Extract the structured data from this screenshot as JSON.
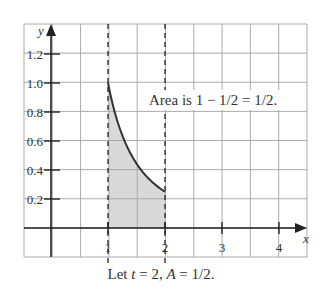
{
  "chart_data": {
    "type": "area",
    "title": "",
    "function": "y = 1/x^2",
    "xlabel": "x",
    "ylabel": "y",
    "x_ticks": [
      "1",
      "2",
      "3",
      "4"
    ],
    "y_ticks": [
      "0.2",
      "0.4",
      "0.6",
      "0.8",
      "1.0",
      "1.2"
    ],
    "xlim": [
      -1,
      5
    ],
    "ylim": [
      -0.2,
      1.4
    ],
    "grid": true,
    "shaded_interval": [
      1,
      2
    ],
    "dashed_lines_x": [
      1,
      2
    ],
    "curve_points": [
      {
        "x": 1.0,
        "y": 1.0
      },
      {
        "x": 1.25,
        "y": 0.64
      },
      {
        "x": 1.5,
        "y": 0.444
      },
      {
        "x": 1.75,
        "y": 0.327
      },
      {
        "x": 2.0,
        "y": 0.25
      }
    ],
    "annotation": "Area is 1 − 1/2 = 1/2."
  },
  "caption": {
    "prefix": "Let ",
    "t_var": "t",
    "mid": " = 2, ",
    "a_var": "A",
    "suffix": " = 1/2."
  },
  "colors": {
    "grid": "#aaaaaa",
    "axis": "#222222",
    "curve": "#333333",
    "fill": "#d9d9d9"
  }
}
